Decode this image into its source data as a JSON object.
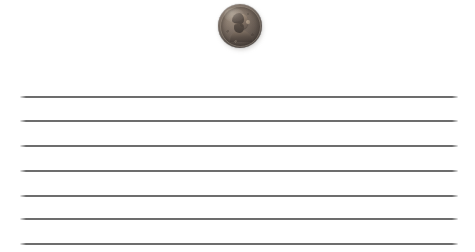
{
  "scene": {
    "title": "Penny resting on ruled notebook paper",
    "width": 475,
    "height": 252,
    "background_color": "#ffffff"
  },
  "coin": {
    "name": "Lincoln cent",
    "denomination": "1 cent",
    "side": "obverse",
    "portrait": "Abraham Lincoln",
    "facing": "right",
    "material_color": "#6d6158",
    "highlight_color": "#9a8c7e",
    "shadow_color": "#443c38",
    "center_x": 240,
    "center_y": 26,
    "diameter": 44
  },
  "paper": {
    "line_color": "#5a5a5a",
    "line_thickness": 2,
    "line_left": 20,
    "line_right": 458,
    "line_count": 7,
    "line_spacing": 24.5,
    "line_y_positions": [
      97,
      121,
      146,
      171,
      196,
      219,
      244
    ]
  }
}
